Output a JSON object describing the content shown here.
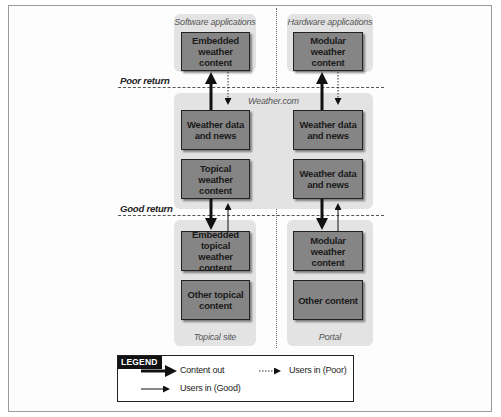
{
  "diagram": {
    "return_labels": {
      "poor": "Poor return",
      "good": "Good return"
    },
    "top_row": {
      "left_panel": {
        "label": "Software applications",
        "box": "Embedded weather content"
      },
      "right_panel": {
        "label": "Hardware applications",
        "box": "Modular weather content"
      }
    },
    "middle_row": {
      "panel_label": "Weather.com",
      "left_boxes": [
        "Weather data and news",
        "Topical weather content"
      ],
      "right_boxes": [
        "Weather data and news",
        "Weather data and news"
      ]
    },
    "bottom_row": {
      "left_panel": {
        "label": "Topical site",
        "boxes": [
          "Embedded topical weather content",
          "Other topical content"
        ]
      },
      "right_panel": {
        "label": "Portal",
        "boxes": [
          "Modular weather content",
          "Other content"
        ]
      }
    },
    "legend": {
      "title": "LEGEND",
      "items": [
        {
          "label": "Content out",
          "style": "thick-solid"
        },
        {
          "label": "Users in (Poor)",
          "style": "dotted"
        },
        {
          "label": "Users in (Good)",
          "style": "thin-solid"
        }
      ]
    },
    "colors": {
      "panel_bg": "#e3e3e3",
      "box_fill": "#858585",
      "box_border": "#222222",
      "legend_title_bg": "#111111"
    }
  }
}
